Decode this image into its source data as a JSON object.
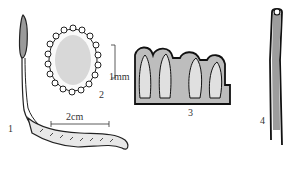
{
  "figure": {
    "panels": [
      {
        "id": "1",
        "label": "1",
        "description": "whole specimen: club-shaped stroma on larval body"
      },
      {
        "id": "2",
        "label": "2",
        "description": "cross section of stroma"
      },
      {
        "id": "3",
        "label": "3",
        "description": "perithecia in section"
      },
      {
        "id": "4",
        "label": "4",
        "description": "ascus"
      }
    ],
    "scale_bars": [
      {
        "label": "2cm",
        "panel": "1"
      },
      {
        "label": "1mm",
        "panel": "2"
      }
    ],
    "colors": {
      "ink": "#222222",
      "background": "#ffffff"
    }
  }
}
